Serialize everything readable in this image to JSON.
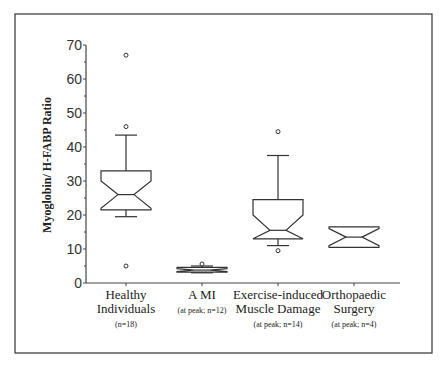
{
  "chart_data": {
    "type": "boxplot",
    "title": "",
    "xlabel": "",
    "ylabel": "Myoglobin/ H-FABP Ratio",
    "ylim": [
      0,
      70
    ],
    "yticks": [
      0,
      10,
      20,
      30,
      40,
      50,
      60,
      70
    ],
    "grid": false,
    "notched": true,
    "categories": [
      {
        "label_lines": [
          "Healthy",
          "Individuals"
        ],
        "sub": "(n=18)"
      },
      {
        "label_lines": [
          "A MI"
        ],
        "sub": "(at peak; n=12)"
      },
      {
        "label_lines": [
          "Exercise-induced",
          "Muscle Damage"
        ],
        "sub": "(at peak; n=14)"
      },
      {
        "label_lines": [
          "Orthopaedic",
          "Surgery"
        ],
        "sub": "(at peak; n=4)"
      }
    ],
    "series": [
      {
        "name": "Healthy Individuals",
        "n": 18,
        "whisker_low": 19.5,
        "q1": 21.5,
        "median": 26,
        "q3": 33,
        "whisker_high": 43.5,
        "notch_low": 22,
        "notch_high": 30,
        "outliers": [
          67,
          46,
          5
        ]
      },
      {
        "name": "AMI",
        "n": 12,
        "whisker_low": 3,
        "q1": 3.2,
        "median": 3.8,
        "q3": 4.6,
        "whisker_high": 5,
        "notch_low": 3.4,
        "notch_high": 4.2,
        "outliers": [
          5.6
        ]
      },
      {
        "name": "Exercise-induced Muscle Damage",
        "n": 14,
        "whisker_low": 11,
        "q1": 13,
        "median": 15.5,
        "q3": 24.5,
        "whisker_high": 37.5,
        "notch_low": 11,
        "notch_high": 20,
        "outliers": [
          44.5,
          9.5
        ]
      },
      {
        "name": "Orthopaedic Surgery",
        "n": 4,
        "whisker_low": 10.5,
        "q1": 10.5,
        "median": 13.5,
        "q3": 16.5,
        "whisker_high": 16.5,
        "notch_low": 11,
        "notch_high": 16,
        "outliers": []
      }
    ]
  }
}
